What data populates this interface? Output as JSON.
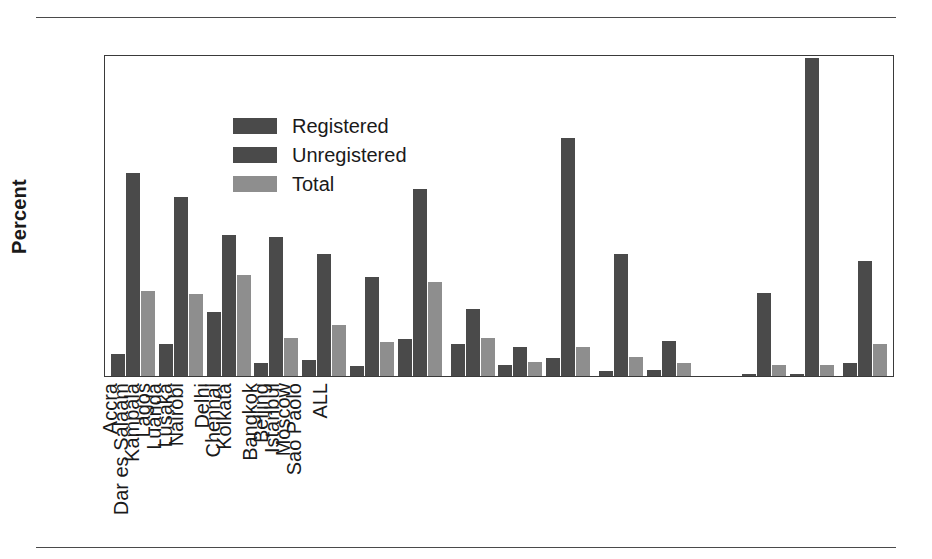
{
  "figure": {
    "has_top_rule": true,
    "has_bottom_rule": true,
    "rule_color": "#4a4a4a"
  },
  "legend": {
    "position": "top-left-inside",
    "entries": [
      {
        "label": "Registered",
        "color": "#4a4a4a"
      },
      {
        "label": "Unregistered",
        "color": "#4a4a4a"
      },
      {
        "label": "Total",
        "color": "#8e8e8e"
      }
    ]
  },
  "axes": {
    "ylabel": "Percent",
    "yticks": [
      "0",
      "20",
      "40",
      "60",
      "80",
      "100"
    ],
    "ymin": 0,
    "ymax": 100
  },
  "chart_data": {
    "type": "bar",
    "title": "",
    "xlabel": "",
    "ylabel": "Percent",
    "ylim": [
      0,
      100
    ],
    "ytick_step": 20,
    "grid": false,
    "legend_position": "upper left (inside axes)",
    "categories": [
      "Accra",
      "Dar es Salaam",
      "Kampala",
      "Lagos",
      "Luanda",
      "Lusaka",
      "Nairobi",
      "Delhi",
      "Chennai",
      "Kolkata",
      "Bangkok",
      "Beijing",
      "Istanbul",
      "Moscow",
      "Sao Paolo",
      "ALL"
    ],
    "group_breaks_after": [
      "Nairobi",
      "Kolkata",
      "Sao Paolo"
    ],
    "series": [
      {
        "name": "Registered",
        "color": "#4a4a4a",
        "values": [
          7,
          10,
          20,
          4,
          5,
          3,
          11.5,
          10,
          3.5,
          5.5,
          1.5,
          2,
          0,
          0.5,
          0.5,
          4
        ]
      },
      {
        "name": "Unregistered",
        "color": "#4a4a4a",
        "values": [
          63.5,
          56,
          44,
          43.5,
          38,
          31,
          58.5,
          21,
          9,
          74.5,
          38,
          11,
          0,
          26,
          99.5,
          36
        ]
      },
      {
        "name": "Total",
        "color": "#8e8e8e",
        "values": [
          26.5,
          25.5,
          31.5,
          12,
          16,
          10.5,
          29.5,
          12,
          4.5,
          9,
          6,
          4,
          0,
          3.5,
          3.5,
          10
        ]
      }
    ]
  }
}
